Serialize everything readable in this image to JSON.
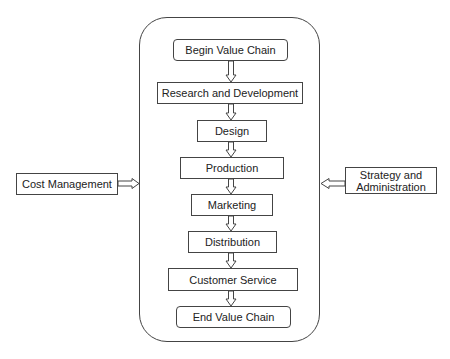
{
  "diagram": {
    "title": "Value Chain",
    "chain_steps": [
      {
        "label": "Begin Value Chain",
        "shape": "rounded"
      },
      {
        "label": "Research and Development",
        "shape": "rect"
      },
      {
        "label": "Design",
        "shape": "rect"
      },
      {
        "label": "Production",
        "shape": "rect"
      },
      {
        "label": "Marketing",
        "shape": "rect"
      },
      {
        "label": "Distribution",
        "shape": "rect"
      },
      {
        "label": "Customer Service",
        "shape": "rect"
      },
      {
        "label": "End Value Chain",
        "shape": "rounded"
      }
    ],
    "left_input": {
      "label": "Cost Management",
      "direction": "right"
    },
    "right_input": {
      "label": "Strategy and Administration",
      "line1": "Strategy and",
      "line2": "Administration",
      "direction": "left"
    },
    "colors": {
      "stroke": "#444444",
      "text": "#222222",
      "background": "#ffffff"
    }
  }
}
